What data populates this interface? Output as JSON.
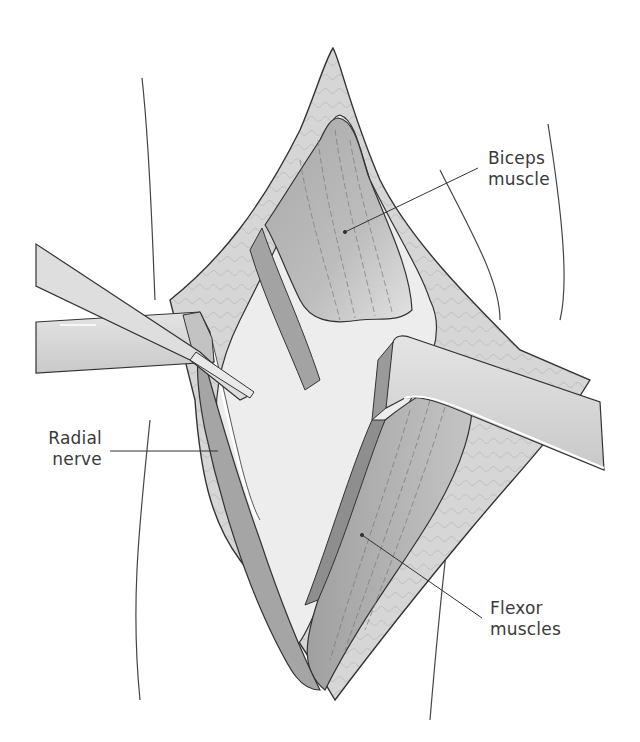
{
  "figure": {
    "type": "surgical-anatomy-illustration",
    "colors": {
      "background": "#ffffff",
      "outline": "#333333",
      "skin_edge": "#d8d8d8",
      "fat_layer": "#cfcfcf",
      "muscle_dark": "#9a9a9a",
      "muscle_mid": "#b5b5b5",
      "retractor": "#d9d9d9",
      "deep_field": "#ececec",
      "label_text": "#3a3a3a"
    },
    "labels": [
      {
        "id": "biceps",
        "line1": "Biceps",
        "line2": "muscle"
      },
      {
        "id": "radial",
        "line1": "Radial",
        "line2": "nerve"
      },
      {
        "id": "flexor",
        "line1": "Flexor",
        "line2": "muscles"
      }
    ],
    "structures": [
      "skin incision",
      "subcutaneous fat",
      "biceps muscle",
      "radial nerve",
      "flexor muscles",
      "left retractor",
      "right retractor",
      "elevator instrument"
    ]
  }
}
